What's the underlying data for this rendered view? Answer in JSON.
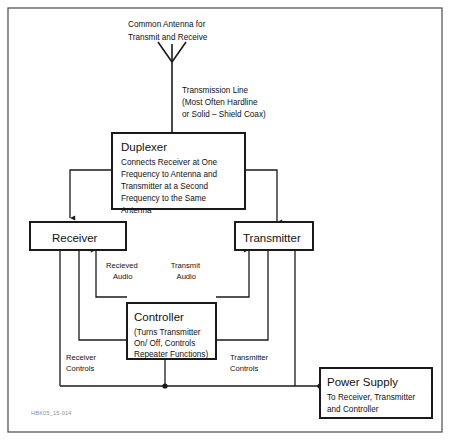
{
  "figure": {
    "caption_id": "HBK05_15-014"
  },
  "antenna": {
    "label_line1": "Common Antenna for",
    "label_line2": "Transmit and Receive"
  },
  "feedline": {
    "label_line1": "Transmission Line",
    "label_line2": "(Most Often Hardline",
    "label_line3": "or Solid – Shield Coax)"
  },
  "blocks": {
    "duplexer": {
      "title": "Duplexer",
      "desc_line1": "Connects Receiver at One",
      "desc_line2": "Frequency to Antenna and",
      "desc_line3": "Transmitter at a Second",
      "desc_line4": "Frequency to the Same",
      "desc_line5": "Antenna"
    },
    "receiver": {
      "title": "Receiver"
    },
    "transmitter": {
      "title": "Transmitter"
    },
    "controller": {
      "title": "Controller",
      "desc_line1": "(Turns Transmitter",
      "desc_line2": "On/ Off, Controls",
      "desc_line3": "Repeater Functions)"
    },
    "power_supply": {
      "title": "Power Supply",
      "desc_line1": "To Receiver, Transmitter",
      "desc_line2": "and Controller"
    }
  },
  "signal_labels": {
    "received_audio_line1": "Recieved",
    "received_audio_line2": "Audio",
    "transmit_audio_line1": "Transmit",
    "transmit_audio_line2": "Audio",
    "receiver_controls_line1": "Receiver",
    "receiver_controls_line2": "Controls",
    "transmitter_controls_line1": "Transmitter",
    "transmitter_controls_line2": "Controls"
  },
  "colors": {
    "line": "#1a1a1a",
    "frame": "#4a4a4a",
    "background": "#ffffff",
    "caption": "#8d8d8d"
  }
}
